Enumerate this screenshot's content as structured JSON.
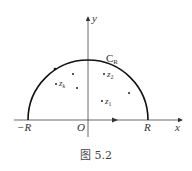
{
  "figure": {
    "caption": "图 5.2",
    "axes": {
      "x_label": "x",
      "y_label": "y",
      "origin_label": "O",
      "neg_R_label": "−R",
      "pos_R_label": "R"
    },
    "contour": {
      "label_main": "C",
      "label_sub": "R"
    },
    "points": [
      {
        "label_main": "z",
        "label_sub": "k"
      },
      {
        "label_main": "z",
        "label_sub": "2"
      },
      {
        "label_main": "z",
        "label_sub": "1"
      }
    ]
  }
}
